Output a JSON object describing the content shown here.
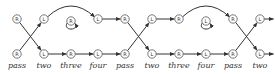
{
  "diagram": {
    "columns_x": [
      17,
      44,
      71,
      98,
      125,
      152,
      179,
      206,
      233,
      260
    ],
    "top_y": 19,
    "bottom_y": 54,
    "label_y": 68,
    "top_row": [
      "R",
      "L",
      "R",
      "L",
      "R",
      "L",
      "R",
      "L",
      "R",
      "L"
    ],
    "bottom_row": [
      "R",
      "L",
      "R",
      "L",
      "R",
      "L",
      "R",
      "L",
      "R",
      "L"
    ],
    "self_loop_columns": [
      2,
      7
    ],
    "labels": [
      "pass",
      "two",
      "three",
      "four",
      "pass",
      "two",
      "three",
      "four",
      "pass",
      "two"
    ],
    "stroke_color": "#333333"
  }
}
